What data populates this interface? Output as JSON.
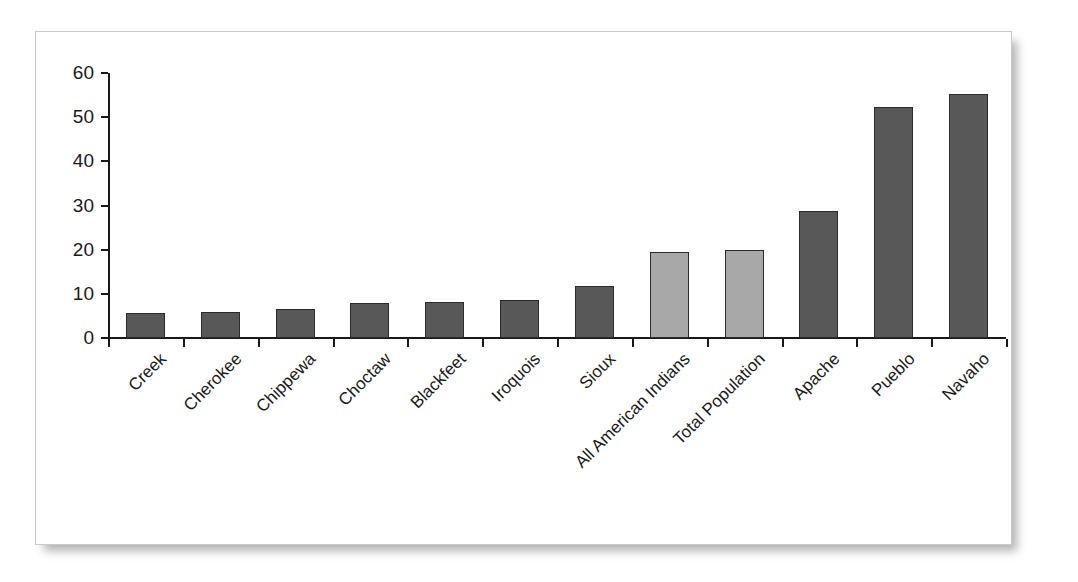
{
  "figure": {
    "frame_border_color": "#c9c9c9",
    "background_color": "#ffffff"
  },
  "chart_data": {
    "type": "bar",
    "title": "",
    "subtitle": "",
    "xlabel": "",
    "ylabel": "",
    "ylim": [
      0,
      60
    ],
    "yticks": [
      0,
      10,
      20,
      30,
      40,
      50,
      60
    ],
    "ytick_labels": [
      "0",
      "10",
      "20",
      "30",
      "40",
      "50",
      "60"
    ],
    "grid": false,
    "legend": null,
    "legend_position": "none",
    "categories": [
      "Creek",
      "Cherokee",
      "Chippewa",
      "Choctaw",
      "Blackfeet",
      "Iroquois",
      "Sioux",
      "All American Indians",
      "Total Population",
      "Apache",
      "Pueblo",
      "Navaho"
    ],
    "values": [
      5.7,
      5.8,
      6.5,
      8.0,
      8.2,
      8.5,
      11.7,
      19.5,
      20.0,
      28.8,
      52.2,
      55.3
    ],
    "bar_colors": [
      "#585858",
      "#585858",
      "#585858",
      "#585858",
      "#585858",
      "#585858",
      "#585858",
      "#a8a8a8",
      "#a8a8a8",
      "#585858",
      "#585858",
      "#585858"
    ],
    "bar_edge_color": "#2b2b2b",
    "axis_color": "#1a1a1a",
    "series": [
      {
        "name": "",
        "values": [
          5.7,
          5.8,
          6.5,
          8.0,
          8.2,
          8.5,
          11.7,
          19.5,
          20.0,
          28.8,
          52.2,
          55.3
        ]
      }
    ]
  }
}
